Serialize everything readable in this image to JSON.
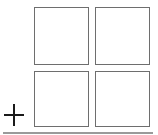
{
  "diagram": {
    "grid": {
      "rows": 2,
      "cols": 2,
      "cells": [
        {
          "row": 0,
          "col": 0,
          "label": ""
        },
        {
          "row": 0,
          "col": 1,
          "label": ""
        },
        {
          "row": 1,
          "col": 0,
          "label": ""
        },
        {
          "row": 1,
          "col": 1,
          "label": ""
        }
      ]
    },
    "symbol": "plus-icon",
    "colors": {
      "square_border": "#6e6e6e",
      "plus": "#1a1a1a",
      "baseline": "#9a9a9a",
      "background": "#ffffff"
    }
  }
}
